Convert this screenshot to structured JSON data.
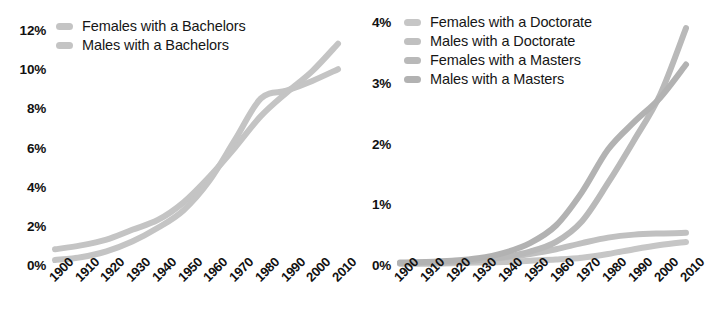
{
  "figure": {
    "background": "#ffffff",
    "panels": [
      "bachelors",
      "advanced"
    ]
  },
  "chart_data": [
    {
      "id": "bachelors",
      "type": "line",
      "title": "",
      "xlabel": "",
      "ylabel": "",
      "grid": false,
      "legend_position": "top-left",
      "x": [
        1900,
        1910,
        1920,
        1930,
        1940,
        1950,
        1960,
        1970,
        1980,
        1990,
        2000,
        2010
      ],
      "xticklabels": [
        "1900",
        "1910",
        "1920",
        "1930",
        "1940",
        "1950",
        "1960",
        "1970",
        "1980",
        "1990",
        "2000",
        "2010"
      ],
      "yticks": [
        0,
        2,
        4,
        6,
        8,
        10,
        12
      ],
      "yticklabels": [
        "0%",
        "2%",
        "4%",
        "6%",
        "8%",
        "10%",
        "12%"
      ],
      "ylim": [
        0,
        12
      ],
      "xlim": [
        1900,
        2010
      ],
      "series": [
        {
          "name": "Females with a Bachelors",
          "color": "#c4c4c4",
          "values": [
            0.8,
            1.0,
            1.3,
            1.8,
            2.3,
            3.2,
            4.5,
            6.0,
            7.6,
            8.8,
            9.9,
            11.3
          ]
        },
        {
          "name": "Males with a Bachelors",
          "color": "#c4c4c4",
          "values": [
            0.25,
            0.4,
            0.7,
            1.2,
            1.9,
            2.8,
            4.3,
            6.4,
            8.5,
            8.9,
            9.4,
            10.0
          ]
        }
      ]
    },
    {
      "id": "advanced",
      "type": "line",
      "title": "",
      "xlabel": "",
      "ylabel": "",
      "grid": false,
      "legend_position": "top-left",
      "x": [
        1900,
        1910,
        1920,
        1930,
        1940,
        1950,
        1960,
        1970,
        1980,
        1990,
        2000,
        2010
      ],
      "xticklabels": [
        "1900",
        "1910",
        "1920",
        "1930",
        "1940",
        "1950",
        "1960",
        "1970",
        "1980",
        "1990",
        "2000",
        "2010"
      ],
      "yticks": [
        0,
        1,
        2,
        3,
        4
      ],
      "yticklabels": [
        "0%",
        "1%",
        "2%",
        "3%",
        "4%"
      ],
      "ylim": [
        0,
        4
      ],
      "xlim": [
        1900,
        2010
      ],
      "series": [
        {
          "name": "Females with a Doctorate",
          "color": "#c6c6c6",
          "values": [
            0.02,
            0.02,
            0.03,
            0.04,
            0.05,
            0.07,
            0.09,
            0.12,
            0.18,
            0.26,
            0.33,
            0.38
          ]
        },
        {
          "name": "Males with a Doctorate",
          "color": "#c0c0c0",
          "values": [
            0.03,
            0.03,
            0.05,
            0.08,
            0.12,
            0.18,
            0.26,
            0.36,
            0.45,
            0.5,
            0.52,
            0.53
          ]
        },
        {
          "name": "Females with a Masters",
          "color": "#b9b9b9",
          "values": [
            0.03,
            0.04,
            0.05,
            0.08,
            0.13,
            0.22,
            0.38,
            0.72,
            1.35,
            2.05,
            2.8,
            3.9
          ]
        },
        {
          "name": "Males with a Masters",
          "color": "#b2b2b2",
          "values": [
            0.04,
            0.05,
            0.07,
            0.11,
            0.2,
            0.36,
            0.65,
            1.2,
            1.9,
            2.35,
            2.75,
            3.3
          ]
        }
      ]
    }
  ],
  "left_panel": {
    "legend": [
      {
        "label": "Females with a Bachelors",
        "color": "#c4c4c4"
      },
      {
        "label": "Males with a Bachelors",
        "color": "#c4c4c4"
      }
    ],
    "yticklabels": [
      "12%",
      "10%",
      "8%",
      "6%",
      "4%",
      "2%",
      "0%"
    ],
    "xticklabels": [
      "1900",
      "1910",
      "1920",
      "1930",
      "1940",
      "1950",
      "1960",
      "1970",
      "1980",
      "1990",
      "2000",
      "2010"
    ]
  },
  "right_panel": {
    "legend": [
      {
        "label": "Females with a Doctorate",
        "color": "#c6c6c6"
      },
      {
        "label": "Males with a Doctorate",
        "color": "#c0c0c0"
      },
      {
        "label": "Females with a Masters",
        "color": "#b9b9b9"
      },
      {
        "label": "Males with a Masters",
        "color": "#b2b2b2"
      }
    ],
    "yticklabels": [
      "4%",
      "3%",
      "2%",
      "1%",
      "0%"
    ],
    "xticklabels": [
      "1900",
      "1910",
      "1920",
      "1930",
      "1940",
      "1950",
      "1960",
      "1970",
      "1980",
      "1990",
      "2000",
      "2010"
    ]
  }
}
